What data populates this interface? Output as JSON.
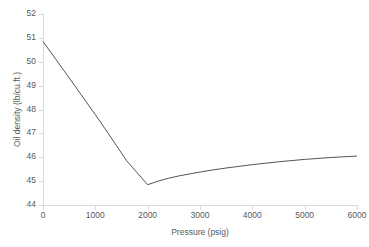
{
  "chart_data": {
    "type": "line",
    "title": "",
    "xlabel": "Pressure (psig)",
    "ylabel": "Oil density (lb/cu.ft.)",
    "xlim": [
      0,
      6000
    ],
    "ylim": [
      44,
      52
    ],
    "xticks": [
      0,
      1000,
      2000,
      3000,
      4000,
      5000,
      6000
    ],
    "yticks": [
      44,
      45,
      46,
      47,
      48,
      49,
      50,
      51,
      52
    ],
    "xtick_labels": [
      "0",
      "1000",
      "2000",
      "3000",
      "4000",
      "5000",
      "6000"
    ],
    "ytick_labels": [
      "44",
      "45",
      "46",
      "47",
      "48",
      "49",
      "50",
      "51",
      "52"
    ],
    "grid": false,
    "legend": null,
    "series": [
      {
        "name": "Oil density",
        "color": "#404040",
        "x": [
          0,
          200,
          400,
          600,
          800,
          1000,
          1200,
          1400,
          1600,
          1800,
          2000,
          2200,
          2400,
          2600,
          2800,
          3000,
          3250,
          3500,
          3750,
          4000,
          4250,
          4500,
          4750,
          5000,
          5250,
          5500,
          5750,
          6000
        ],
        "y": [
          50.85,
          50.24,
          49.63,
          49.02,
          48.4,
          47.78,
          47.15,
          46.5,
          45.85,
          45.35,
          44.85,
          45.0,
          45.12,
          45.22,
          45.3,
          45.38,
          45.47,
          45.55,
          45.62,
          45.69,
          45.75,
          45.81,
          45.86,
          45.91,
          45.95,
          45.99,
          46.02,
          46.05
        ]
      }
    ],
    "annotations": [
      {
        "label": "bubble-point minimum",
        "x": 2000,
        "y": 44.85
      }
    ]
  },
  "axes": {
    "y_title": "Oil density (lb/cu.ft.)",
    "x_title": "Pressure (psig)"
  }
}
